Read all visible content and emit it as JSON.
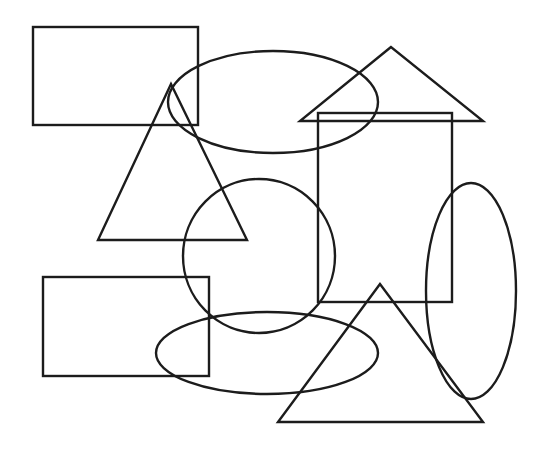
{
  "canvas": {
    "width": 545,
    "height": 449,
    "background": "#ffffff",
    "stroke": "#1c1c1c",
    "stroke_width": 2.4
  },
  "shapes": {
    "rectangles": [
      {
        "name": "rect-top-left",
        "x": 33,
        "y": 27,
        "w": 165,
        "h": 98
      },
      {
        "name": "rect-center-right",
        "x": 318,
        "y": 113,
        "w": 134,
        "h": 189
      },
      {
        "name": "rect-bottom-left",
        "x": 43,
        "y": 277,
        "w": 166,
        "h": 99
      }
    ],
    "ellipses": [
      {
        "name": "ellipse-top-center",
        "cx": 273,
        "cy": 102,
        "rx": 105,
        "ry": 51
      },
      {
        "name": "circle-center",
        "cx": 259,
        "cy": 256,
        "rx": 76,
        "ry": 77
      },
      {
        "name": "ellipse-right-vertical",
        "cx": 471,
        "cy": 291,
        "rx": 45,
        "ry": 108
      },
      {
        "name": "ellipse-bottom-center",
        "cx": 267,
        "cy": 353,
        "rx": 111,
        "ry": 41
      }
    ],
    "triangles": [
      {
        "name": "triangle-left-tall",
        "points": "171,84 98,240 247,240"
      },
      {
        "name": "triangle-top-right",
        "points": "391,47 300,121 483,121"
      },
      {
        "name": "triangle-bottom-right",
        "points": "380,284 278,422 483,422"
      }
    ]
  }
}
